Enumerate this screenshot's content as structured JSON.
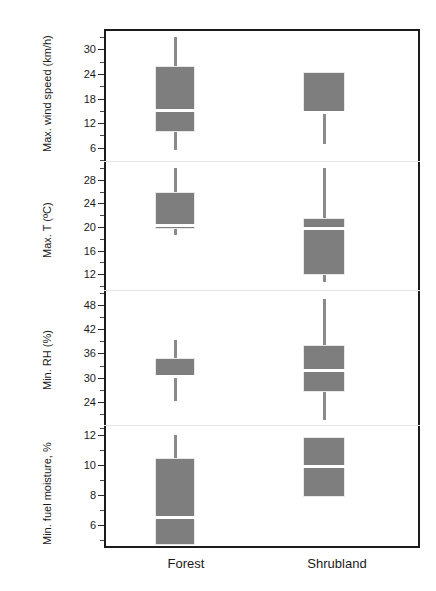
{
  "chart_data": {
    "type": "box",
    "title": "",
    "xlabel": "",
    "categories": [
      "Forest",
      "Shrubland"
    ],
    "grid": false,
    "legend": "none",
    "panels": [
      {
        "id": "max-wind-speed",
        "ylabel": "Max. wind speed (km/h)",
        "ylim": [
          3.0,
          34.5
        ],
        "ticks": [
          6,
          12,
          18,
          24,
          30
        ],
        "ticklabels": [
          "6",
          "12",
          "18",
          "24",
          "30"
        ],
        "minor_ticks": [
          3,
          9,
          15,
          21,
          27,
          33
        ],
        "boxes": [
          {
            "category": "Forest",
            "whisker_low": 5.5,
            "q1": 9.8,
            "median": 15.0,
            "q3": 26.0,
            "whisker_high": 33.0
          },
          {
            "category": "Shrubland",
            "whisker_low": 6.9,
            "q1": 14.3,
            "median": 14.6,
            "q3": 24.6,
            "whisker_high": 24.6
          }
        ]
      },
      {
        "id": "max-temperature",
        "ylabel": "Max. T (ºC)",
        "ylim": [
          9.5,
          31.0
        ],
        "ticks": [
          12,
          16,
          20,
          24,
          28
        ],
        "ticklabels": [
          "12",
          "16",
          "20",
          "24",
          "28"
        ],
        "minor_ticks": [
          10,
          14,
          18,
          22,
          26,
          30
        ],
        "boxes": [
          {
            "category": "Forest",
            "whisker_low": 18.6,
            "q1": 19.7,
            "median": 20.3,
            "q3": 26.0,
            "whisker_high": 29.9
          },
          {
            "category": "Shrubland",
            "whisker_low": 10.7,
            "q1": 11.9,
            "median": 19.8,
            "q3": 21.5,
            "whisker_high": 29.9
          }
        ]
      },
      {
        "id": "min-relative-humidity",
        "ylabel": "Min. RH (%)",
        "ylim": [
          18.5,
          51.5
        ],
        "ticks": [
          24,
          30,
          36,
          42,
          48
        ],
        "ticklabels": [
          "24",
          "30",
          "36",
          "42",
          "48"
        ],
        "minor_ticks": [
          21,
          27,
          33,
          39,
          45,
          51
        ],
        "boxes": [
          {
            "category": "Forest",
            "whisker_low": 24.3,
            "q1": 30.0,
            "median": 30.3,
            "q3": 34.8,
            "whisker_high": 39.4
          },
          {
            "category": "Shrubland",
            "whisker_low": 19.5,
            "q1": 26.5,
            "median": 31.8,
            "q3": 38.0,
            "whisker_high": 49.5
          }
        ]
      },
      {
        "id": "min-fuel-moisture",
        "ylabel": "Min. fuel moisture, %",
        "ylim": [
          4.6,
          12.6
        ],
        "ticks": [
          6,
          8,
          10,
          12
        ],
        "ticklabels": [
          "6",
          "8",
          "10",
          "12"
        ],
        "minor_ticks": [
          5,
          7,
          9,
          11,
          12.5
        ],
        "boxes": [
          {
            "category": "Forest",
            "whisker_low": 4.7,
            "q1": 4.7,
            "median": 6.5,
            "q3": 10.5,
            "whisker_high": 12.0
          },
          {
            "category": "Shrubland",
            "whisker_low": 7.9,
            "q1": 7.9,
            "median": 9.9,
            "q3": 11.9,
            "whisker_high": 11.9
          }
        ]
      }
    ]
  },
  "colors": {
    "box_fill": "#7e7e7e",
    "median": "#ffffff",
    "whisker": "#8a8a8a",
    "frame": "#1b1b1b",
    "separator": "#e3e3e3",
    "background": "#ffffff",
    "text": "#1a1a1a"
  }
}
